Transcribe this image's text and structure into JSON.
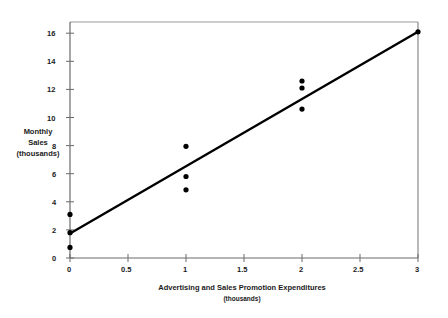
{
  "chart_data": {
    "type": "scatter",
    "title": "",
    "xlabel": "Advertising and Sales Promotion Expenditures",
    "xlabel_sub": "(thousands)",
    "ylabel_line1": "Monthly",
    "ylabel_line2": "Sales",
    "ylabel_line3": "(thousands)",
    "xlim": [
      0,
      3
    ],
    "ylim": [
      0,
      16.8
    ],
    "xticks": [
      0,
      0.5,
      1,
      1.5,
      2,
      2.5,
      3
    ],
    "xtick_labels": [
      "0",
      "0.5",
      "1",
      "1.5",
      "2",
      "2.5",
      "3"
    ],
    "yticks": [
      0,
      2,
      4,
      6,
      8,
      10,
      12,
      14,
      16
    ],
    "ytick_labels": [
      "0",
      "2",
      "4",
      "6",
      "8",
      "10",
      "12",
      "14",
      "16"
    ],
    "grid": false,
    "legend": null,
    "marker": "filled-circle",
    "marker_color": "#000000",
    "points": [
      {
        "x": 0,
        "y": 3.1
      },
      {
        "x": 0,
        "y": 1.8
      },
      {
        "x": 0,
        "y": 0.75
      },
      {
        "x": 1,
        "y": 7.95
      },
      {
        "x": 1,
        "y": 5.8
      },
      {
        "x": 1,
        "y": 4.85
      },
      {
        "x": 2,
        "y": 12.6
      },
      {
        "x": 2,
        "y": 12.1
      },
      {
        "x": 2,
        "y": 10.6
      },
      {
        "x": 3,
        "y": 16.1
      }
    ],
    "trendline": {
      "type": "linear-regression",
      "x_start": 0,
      "y_start": 1.75,
      "x_end": 3,
      "y_end": 16.1,
      "color": "#000000"
    },
    "frame_color": "#8c8c8c",
    "axis_color": "#595959"
  }
}
